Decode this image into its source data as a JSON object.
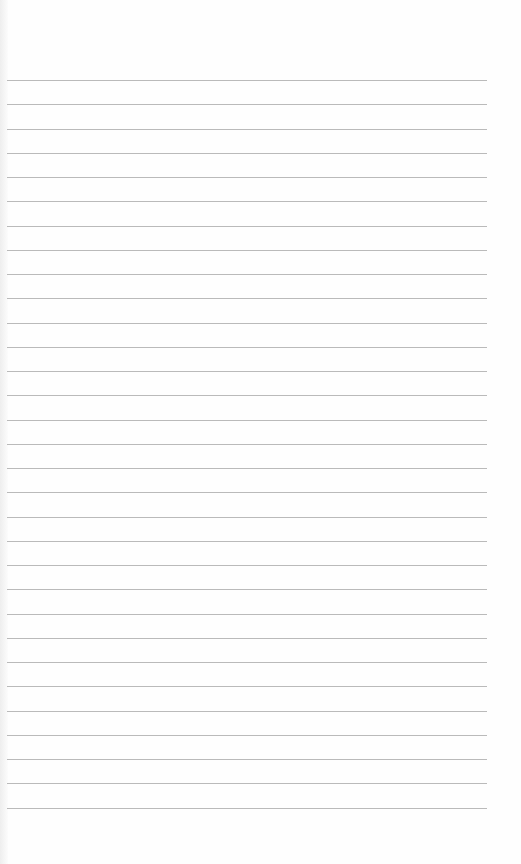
{
  "image": {
    "subject": "blank lined notebook paper",
    "background_color": "#fefefe",
    "line_color": "#a9a9a9",
    "line_count": 31,
    "first_line_y": 80,
    "line_spacing": 24.25,
    "line_left_x": 7,
    "line_right_x": 487
  }
}
